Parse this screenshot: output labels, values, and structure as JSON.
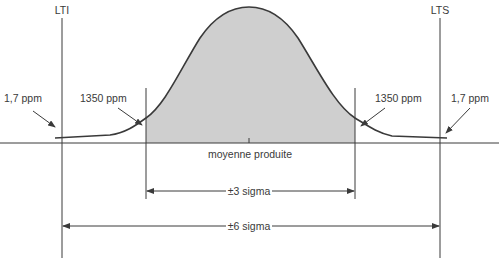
{
  "diagram": {
    "type": "normal-distribution-six-sigma",
    "colors": {
      "background": "#ffffff",
      "line": "#3a3a3a",
      "curve_fill": "#cfcfcf",
      "text": "#3a3a3a"
    },
    "limits": {
      "lower": "LTI",
      "upper": "LTS"
    },
    "tail_labels": {
      "left_outer": "1,7 ppm",
      "left_inner": "1350 ppm",
      "right_inner": "1350 ppm",
      "right_outer": "1,7 ppm"
    },
    "center_label": "moyenne produite",
    "ranges": {
      "three_sigma": "±3 sigma",
      "six_sigma": "±6 sigma"
    }
  }
}
